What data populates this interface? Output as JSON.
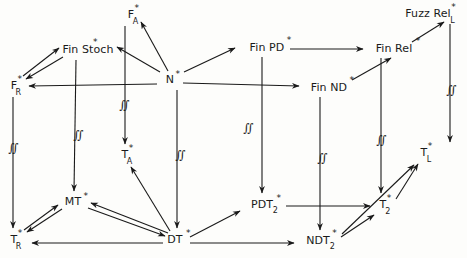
{
  "diagram": {
    "stroke_color": "#1a1a1a",
    "background_color": "#fdfdfb",
    "nodes": [
      {
        "id": "FA",
        "base": "F",
        "sup": "*",
        "sub": "A",
        "x": 131,
        "y": 14,
        "label": "F*_A"
      },
      {
        "id": "FuzzRelL",
        "base": "Fuzz Rel",
        "sup": "*",
        "sub": "L",
        "x": 428,
        "y": 13,
        "label": "Fuzz Rel*_L"
      },
      {
        "id": "FinStoch",
        "base": "Fin Stoch",
        "sup": "*",
        "sub": "",
        "x": 88,
        "y": 49,
        "label": "Fin Stoch*"
      },
      {
        "id": "FinPD",
        "base": "Fin PD",
        "sup": "*",
        "sub": "",
        "x": 267,
        "y": 47,
        "label": "Fin PD*"
      },
      {
        "id": "FinRel",
        "base": "Fin Rel",
        "sup": "*",
        "sub": "",
        "x": 394,
        "y": 48,
        "label": "Fin Rel*"
      },
      {
        "id": "FR",
        "base": "F",
        "sup": "*",
        "sub": "R",
        "x": 14,
        "y": 85,
        "label": "F*_R"
      },
      {
        "id": "N",
        "base": "N",
        "sup": "*",
        "sub": "",
        "x": 170,
        "y": 79,
        "label": "N*"
      },
      {
        "id": "FinND",
        "base": "Fin ND",
        "sup": "*",
        "sub": "",
        "x": 329,
        "y": 87,
        "label": "Fin ND*"
      },
      {
        "id": "TA",
        "base": "T",
        "sup": "*",
        "sub": "A",
        "x": 125,
        "y": 154,
        "label": "T*_A"
      },
      {
        "id": "TL",
        "base": "T",
        "sup": "*",
        "sub": "L",
        "x": 424,
        "y": 152,
        "label": "T*_L"
      },
      {
        "id": "MT",
        "base": "MT",
        "sup": "*",
        "sub": "",
        "x": 73,
        "y": 201,
        "label": "MT*"
      },
      {
        "id": "PDT2",
        "base": "PDT",
        "sup": "*",
        "sub": "2",
        "x": 262,
        "y": 204,
        "label": "PDT*_2"
      },
      {
        "id": "T2",
        "base": "T",
        "sup": "*",
        "sub": "2",
        "x": 383,
        "y": 204,
        "label": "T*_2"
      },
      {
        "id": "TR",
        "base": "T",
        "sup": "*",
        "sub": "R",
        "x": 14,
        "y": 239,
        "label": "T*_R"
      },
      {
        "id": "DT",
        "base": "DT",
        "sup": "*",
        "sub": "",
        "x": 175,
        "y": 239,
        "label": "DT*"
      },
      {
        "id": "NDT2",
        "base": "NDT",
        "sup": "*",
        "sub": "2",
        "x": 318,
        "y": 240,
        "label": "NDT*_2"
      }
    ],
    "integral_markers": [
      {
        "id": "m-fr-tr",
        "glyph": "∬",
        "x": 13,
        "y": 148
      },
      {
        "id": "m-stoch-mt",
        "glyph": "∬",
        "x": 78,
        "y": 135
      },
      {
        "id": "m-fa-ta",
        "glyph": "∬",
        "x": 124,
        "y": 105
      },
      {
        "id": "m-n-dt",
        "glyph": "∬",
        "x": 180,
        "y": 155
      },
      {
        "id": "m-pd-pdt",
        "glyph": "∬",
        "x": 248,
        "y": 128
      },
      {
        "id": "m-nd-ndt",
        "glyph": "∬",
        "x": 322,
        "y": 158
      },
      {
        "id": "m-rel-t2",
        "glyph": "∬",
        "x": 381,
        "y": 140
      },
      {
        "id": "m-fuzz-tl",
        "glyph": "∬",
        "x": 451,
        "y": 90
      }
    ],
    "edges": [
      {
        "id": "e-N-FinStoch",
        "from": "N*",
        "to": "Fin Stoch*",
        "style": "solid-arrow"
      },
      {
        "id": "e-N-FR",
        "from": "N*",
        "to": "F*_R",
        "style": "solid-arrow"
      },
      {
        "id": "e-FinStoch-FR",
        "from": "Fin Stoch*",
        "to": "F*_R",
        "style": "solid-arrow"
      },
      {
        "id": "e-N-FA",
        "from": "N*",
        "to": "F*_A",
        "style": "solid-arrow"
      },
      {
        "id": "e-N-FinPD",
        "from": "N*",
        "to": "Fin PD*",
        "style": "solid-arrow"
      },
      {
        "id": "e-N-FinND",
        "from": "N*",
        "to": "Fin ND*",
        "style": "solid-arrow"
      },
      {
        "id": "e-FinPD-FinRel",
        "from": "Fin PD*",
        "to": "Fin Rel*",
        "style": "solid-arrow"
      },
      {
        "id": "e-FinND-FinRel",
        "from": "Fin ND*",
        "to": "Fin Rel*",
        "style": "solid-arrow"
      },
      {
        "id": "e-FinRel-Fuzz",
        "from": "Fin Rel*",
        "to": "Fuzz Rel*_L",
        "style": "solid-arrow"
      },
      {
        "id": "e-FA-TA",
        "from": "F*_A",
        "to": "T*_A",
        "style": "vertical-arrow"
      },
      {
        "id": "e-FR-TR",
        "from": "F*_R",
        "to": "T*_R",
        "style": "vertical-arrow"
      },
      {
        "id": "e-FinStoch-MT",
        "from": "Fin Stoch*",
        "to": "MT*",
        "style": "vertical-arrow"
      },
      {
        "id": "e-N-DT",
        "from": "N*",
        "to": "DT*",
        "style": "vertical-arrow"
      },
      {
        "id": "e-FinPD-PDT2",
        "from": "Fin PD*",
        "to": "PDT*_2",
        "style": "vertical-arrow"
      },
      {
        "id": "e-FinND-NDT2",
        "from": "Fin ND*",
        "to": "NDT*_2",
        "style": "vertical-arrow"
      },
      {
        "id": "e-FinRel-T2",
        "from": "Fin Rel*",
        "to": "T*_2",
        "style": "vertical-arrow"
      },
      {
        "id": "e-Fuzz-TL",
        "from": "Fuzz Rel*_L",
        "to": "T*_L",
        "style": "vertical-arrow"
      },
      {
        "id": "e-DT-MT",
        "from": "DT*",
        "to": "MT*",
        "style": "solid-arrow"
      },
      {
        "id": "e-DT-TR",
        "from": "DT*",
        "to": "T*_R",
        "style": "solid-arrow"
      },
      {
        "id": "e-MT-TR",
        "from": "MT*",
        "to": "T*_R",
        "style": "solid-arrow"
      },
      {
        "id": "e-DT-TA",
        "from": "DT*",
        "to": "T*_A",
        "style": "solid-arrow"
      },
      {
        "id": "e-DT-PDT2",
        "from": "DT*",
        "to": "PDT*_2",
        "style": "solid-arrow"
      },
      {
        "id": "e-DT-NDT2",
        "from": "DT*",
        "to": "NDT*_2",
        "style": "solid-arrow"
      },
      {
        "id": "e-PDT2-T2",
        "from": "PDT*_2",
        "to": "T*_2",
        "style": "solid-arrow"
      },
      {
        "id": "e-NDT2-T2",
        "from": "NDT*_2",
        "to": "T*_2",
        "style": "solid-arrow"
      },
      {
        "id": "e-T2-TL",
        "from": "T*_2",
        "to": "T*_L",
        "style": "solid-arrow"
      }
    ]
  }
}
